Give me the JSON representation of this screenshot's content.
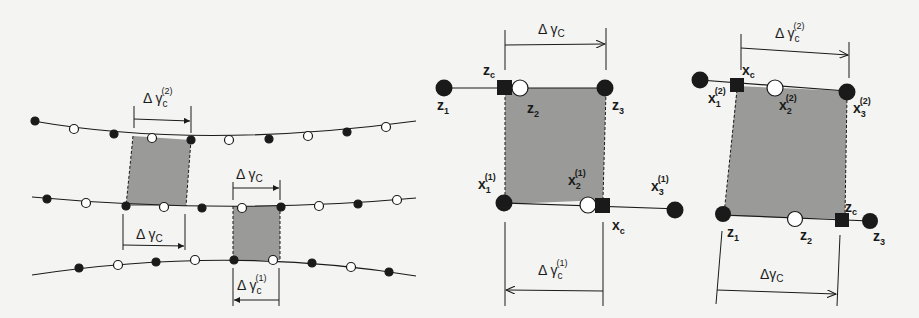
{
  "figure": {
    "panel_left": {
      "labels": {
        "top_delta": "Δ γ",
        "top_sub": "c",
        "top_sup": "(2)",
        "mid_left_delta": "Δ γ",
        "mid_left_sub": "C",
        "mid_right_delta": "Δ γ",
        "mid_right_sub": "C",
        "bottom_delta": "Δ γ",
        "bottom_sub": "c",
        "bottom_sup": "(1)"
      }
    },
    "panel_middle": {
      "labels": {
        "delta_top": "Δ γ",
        "delta_top_sub": "C",
        "zc": "z",
        "zc_sub": "c",
        "z1": "z",
        "z1_sub": "1",
        "z2": "z",
        "z2_sub": "2",
        "z3": "z",
        "z3_sub": "3",
        "x1": "x",
        "x1_sub": "1",
        "x1_sup": "(1)",
        "x2": "x",
        "x2_sub": "2",
        "x2_sup": "(1)",
        "x3": "x",
        "x3_sub": "3",
        "x3_sup": "(1)",
        "xc": "x",
        "xc_sub": "c",
        "delta_bottom": "Δ γ",
        "delta_bottom_sub": "c",
        "delta_bottom_sup": "(1)"
      }
    },
    "panel_right": {
      "labels": {
        "delta_top": "Δ γ",
        "delta_top_sub": "c",
        "delta_top_sup": "(2)",
        "xc": "x",
        "xc_sub": "c",
        "x1": "x",
        "x1_sub": "1",
        "x1_sup": "(2)",
        "x2": "x",
        "x2_sub": "2",
        "x2_sup": "(2)",
        "x3": "x",
        "x3_sub": "3",
        "x3_sup": "(2)",
        "z1": "z",
        "z1_sub": "1",
        "z2": "z",
        "z2_sub": "2",
        "zc": "z",
        "zc_sub": "c",
        "z3": "z",
        "z3_sub": "3",
        "delta_bottom": "Δγ",
        "delta_bottom_sub": "C"
      }
    },
    "colors": {
      "shade": "#9a9a98",
      "ink": "#1a1a1a"
    }
  }
}
